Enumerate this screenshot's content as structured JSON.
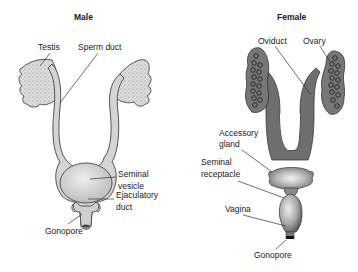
{
  "male": {
    "title": "Male",
    "labels": {
      "testis": "Testis",
      "sperm_duct": "Sperm duct",
      "seminal_vesicle_1": "Seminal",
      "seminal_vesicle_2": "vesicle",
      "ejaculatory_duct_1": "Ejaculatory",
      "ejaculatory_duct_2": "duct",
      "gonopore": "Gonopore"
    }
  },
  "female": {
    "title": "Female",
    "labels": {
      "oviduct": "Oviduct",
      "ovary": "Ovary",
      "accessory_gland_1": "Accessory",
      "accessory_gland_2": "gland",
      "seminal_receptacle_1": "Seminal",
      "seminal_receptacle_2": "receptacle",
      "vagina": "Vagina",
      "gonopore": "Gonopore"
    }
  },
  "colors": {
    "male_fill": "#d4d4d4",
    "male_outline": "#555555",
    "female_fill": "#6e6e6e",
    "female_outline": "#3a3a3a",
    "text": "#222222"
  }
}
